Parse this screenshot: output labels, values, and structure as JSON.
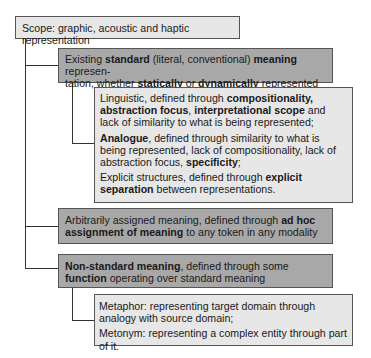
{
  "diagram": {
    "root": {
      "text": "Scope: graphic, acoustic and haptic representation",
      "fill": "#e7e7e7"
    },
    "standard": {
      "parts": [
        "Existing ",
        "standard",
        " (literal, conventional) ",
        "meaning",
        " represen-",
        "tation, whether ",
        "statically",
        " or ",
        "dynamically",
        " represented"
      ],
      "fill": "#a8a8a8",
      "children": {
        "linguistic": [
          "Linguistic, defined through ",
          "compositionality,",
          "abstraction focus",
          ", ",
          "interpretational scope",
          " and lack of similarity to what is being represented;"
        ],
        "analogue": [
          "Analogue",
          ", defined through similarity to what is being represented, lack of compositionality, lack of abstraction focus, ",
          "specificity",
          ";"
        ],
        "explicit": [
          "Explicit structures, defined through ",
          "explicit separation",
          " between representations."
        ]
      }
    },
    "arbitrary": {
      "parts": [
        "Arbitrarily assigned meaning, defined through ",
        "ad hoc assignment of meaning",
        " to any token in any modality"
      ],
      "fill": "#a8a8a8"
    },
    "nonstandard": {
      "parts": [
        "Non-standard meaning",
        ", defined through some ",
        "function",
        " operating over standard meaning"
      ],
      "fill": "#a8a8a8",
      "children": {
        "metaphor": "Metaphor: representing target domain through analogy with source domain;",
        "metonym": "Metonym: representing a complex entity through part of it."
      }
    }
  }
}
